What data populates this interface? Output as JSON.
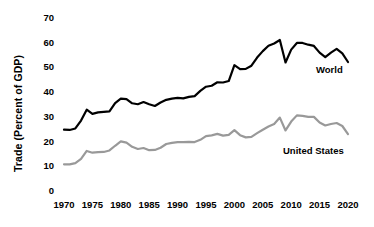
{
  "chart_data": {
    "type": "line",
    "title": "",
    "subtitle": "",
    "xlabel": "",
    "ylabel": "Trade (Percent of GDP)",
    "xlim": [
      1970,
      2021
    ],
    "ylim": [
      0,
      70
    ],
    "yticks": [
      70,
      60,
      50,
      40,
      30,
      20,
      10,
      0
    ],
    "xticks": [
      1970,
      1975,
      1980,
      1985,
      1990,
      1995,
      2000,
      2005,
      2010,
      2015,
      2020
    ],
    "grid": false,
    "legend_position": "inline-right",
    "x": [
      1970,
      1971,
      1972,
      1973,
      1974,
      1975,
      1976,
      1977,
      1978,
      1979,
      1980,
      1981,
      1982,
      1983,
      1984,
      1985,
      1986,
      1987,
      1988,
      1989,
      1990,
      1991,
      1992,
      1993,
      1994,
      1995,
      1996,
      1997,
      1998,
      1999,
      2000,
      2001,
      2002,
      2003,
      2004,
      2005,
      2006,
      2007,
      2008,
      2009,
      2010,
      2011,
      2012,
      2013,
      2014,
      2015,
      2016,
      2017,
      2018,
      2019,
      2020
    ],
    "series": [
      {
        "name": "World",
        "color": "#000000",
        "label": "World",
        "values": [
          24.8,
          24.7,
          25.3,
          28.5,
          32.9,
          31.2,
          31.8,
          32.0,
          32.2,
          35.6,
          37.4,
          37.2,
          35.5,
          35.1,
          36.0,
          35.1,
          34.4,
          35.8,
          36.9,
          37.4,
          37.7,
          37.5,
          38.1,
          38.4,
          40.5,
          42.2,
          42.6,
          44.0,
          43.9,
          44.5,
          50.9,
          49.3,
          49.4,
          50.7,
          54.0,
          56.6,
          58.8,
          59.7,
          61.1,
          52.0,
          57.2,
          59.9,
          59.9,
          59.2,
          58.7,
          56.0,
          54.2,
          56.0,
          57.5,
          55.7,
          52.2
        ]
      },
      {
        "name": "United States",
        "color": "#999999",
        "label": "United States",
        "values": [
          10.8,
          10.8,
          11.3,
          13.0,
          16.2,
          15.5,
          15.7,
          15.8,
          16.4,
          18.3,
          20.1,
          19.6,
          17.9,
          17.0,
          17.4,
          16.5,
          16.6,
          17.5,
          19.0,
          19.5,
          19.8,
          19.8,
          19.9,
          19.8,
          20.7,
          22.2,
          22.5,
          23.1,
          22.4,
          22.7,
          24.6,
          22.6,
          21.7,
          21.9,
          23.4,
          24.8,
          26.1,
          27.1,
          29.7,
          24.5,
          28.1,
          30.6,
          30.4,
          30.0,
          30.0,
          27.7,
          26.5,
          27.1,
          27.5,
          26.3,
          23.0
        ]
      }
    ],
    "annotations": [
      {
        "text": "World",
        "x": 2019,
        "y": 52
      },
      {
        "text": "United States",
        "x": 2014,
        "y": 18
      }
    ]
  },
  "axes": {
    "ylabel": "Trade (Percent of GDP)",
    "ytick_labels": [
      "70",
      "60",
      "50",
      "40",
      "30",
      "20",
      "10",
      "0"
    ],
    "xtick_labels": [
      "1970",
      "1975",
      "1980",
      "1985",
      "1990",
      "1995",
      "2000",
      "2005",
      "2010",
      "2015",
      "2020"
    ]
  }
}
